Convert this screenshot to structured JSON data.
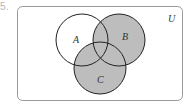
{
  "problem": {
    "number": "55."
  },
  "diagram": {
    "type": "venn",
    "universe_label": "U",
    "sets": [
      {
        "label": "A",
        "cx": 82,
        "cy": 40,
        "r": 26,
        "label_x": 76,
        "label_y": 44
      },
      {
        "label": "B",
        "cx": 119,
        "cy": 40,
        "r": 26,
        "label_x": 124,
        "label_y": 40
      },
      {
        "label": "C",
        "cx": 100,
        "cy": 68,
        "r": 26,
        "label_x": 100,
        "label_y": 80
      }
    ],
    "shaded_region": "B ∪ C",
    "colors": {
      "shade": "#bdbdbd",
      "stroke": "#222222",
      "frame": "#9a9a9a",
      "background": "#ffffff"
    }
  }
}
